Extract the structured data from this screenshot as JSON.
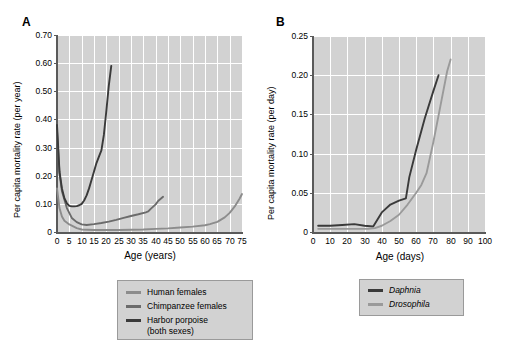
{
  "figure": {
    "panels": [
      {
        "label": "A",
        "ylabel": "Per capita mortality rate (per year)",
        "xlabel": "Age (years)"
      },
      {
        "label": "B",
        "ylabel": "Per capita mortality rate (per day)",
        "xlabel": "Age (days)"
      }
    ]
  },
  "legend_a": {
    "items": [
      {
        "label": "Human females",
        "color": "#8c8c8c"
      },
      {
        "label": "Chimpanzee females",
        "color": "#6b6b6b"
      },
      {
        "label": "Harbor porpoise\n(both sexes)",
        "color": "#3a3a3a"
      }
    ]
  },
  "legend_b": {
    "items": [
      {
        "label": "Daphnia",
        "color": "#3a3a3a"
      },
      {
        "label": "Drosophila",
        "color": "#9a9a9a"
      }
    ]
  },
  "chart_data": [
    {
      "type": "line",
      "panel": "A",
      "title": "",
      "xlabel": "Age (years)",
      "ylabel": "Per capita mortality rate (per year)",
      "xlim": [
        0,
        75
      ],
      "ylim": [
        0,
        0.7
      ],
      "xticks": [
        0,
        5,
        10,
        15,
        20,
        25,
        30,
        35,
        40,
        45,
        50,
        55,
        60,
        65,
        70,
        75
      ],
      "xticklabels": [
        "0",
        "5",
        "10",
        "15",
        "20",
        "25",
        "30",
        "35",
        "40",
        "45",
        "50",
        "55",
        "60",
        "65",
        "70",
        "75"
      ],
      "yticks": [
        0,
        0.1,
        0.2,
        0.3,
        0.4,
        0.5,
        0.6,
        0.7
      ],
      "yticklabels": [
        "0",
        "0.10",
        "0.20",
        "0.30",
        "0.40",
        "0.50",
        "0.60",
        "0.70"
      ],
      "grid": true,
      "legend_position": "below",
      "series": [
        {
          "name": "Human females",
          "color": "#8c8c8c",
          "x": [
            0,
            1,
            2,
            3,
            5,
            8,
            10,
            15,
            20,
            25,
            30,
            35,
            40,
            45,
            50,
            55,
            60,
            62,
            65,
            68,
            70,
            72,
            74,
            75
          ],
          "y": [
            0.155,
            0.085,
            0.055,
            0.04,
            0.027,
            0.014,
            0.009,
            0.007,
            0.007,
            0.007,
            0.008,
            0.009,
            0.011,
            0.013,
            0.016,
            0.019,
            0.024,
            0.028,
            0.036,
            0.052,
            0.068,
            0.09,
            0.118,
            0.135
          ]
        },
        {
          "name": "Chimpanzee females",
          "color": "#6b6b6b",
          "x": [
            0,
            1,
            2,
            4,
            6,
            8,
            10,
            12,
            15,
            18,
            21,
            24,
            27,
            30,
            33,
            36,
            37,
            38,
            40,
            41,
            43
          ],
          "y": [
            0.36,
            0.21,
            0.145,
            0.085,
            0.05,
            0.035,
            0.027,
            0.025,
            0.028,
            0.032,
            0.037,
            0.043,
            0.05,
            0.057,
            0.063,
            0.07,
            0.073,
            0.082,
            0.098,
            0.11,
            0.125
          ]
        },
        {
          "name": "Harbor porpoise (both sexes)",
          "color": "#3a3a3a",
          "x": [
            0,
            1,
            2,
            3,
            4,
            5,
            6,
            7,
            8,
            9,
            10,
            11,
            12,
            13,
            14,
            15,
            16,
            17,
            18,
            19,
            20,
            21,
            22
          ],
          "y": [
            0.38,
            0.215,
            0.155,
            0.12,
            0.102,
            0.093,
            0.091,
            0.091,
            0.092,
            0.095,
            0.1,
            0.112,
            0.13,
            0.155,
            0.185,
            0.215,
            0.245,
            0.268,
            0.29,
            0.345,
            0.43,
            0.52,
            0.59
          ]
        }
      ]
    },
    {
      "type": "line",
      "panel": "B",
      "title": "",
      "xlabel": "Age (days)",
      "ylabel": "Per capita mortality rate (per day)",
      "xlim": [
        0,
        100
      ],
      "ylim": [
        0,
        0.25
      ],
      "xticks": [
        0,
        10,
        20,
        30,
        40,
        50,
        60,
        70,
        80,
        90,
        100
      ],
      "xticklabels": [
        "0",
        "10",
        "20",
        "30",
        "40",
        "50",
        "60",
        "70",
        "80",
        "90",
        "100"
      ],
      "yticks": [
        0,
        0.05,
        0.1,
        0.15,
        0.2,
        0.25
      ],
      "yticklabels": [
        "0",
        "0.05",
        "0.10",
        "0.15",
        "0.20",
        "0.25"
      ],
      "grid": true,
      "legend_position": "below",
      "series": [
        {
          "name": "Daphnia",
          "color": "#3a3a3a",
          "x": [
            3,
            10,
            17,
            24,
            30,
            35,
            40,
            45,
            50,
            54,
            56,
            60,
            65,
            70,
            73
          ],
          "y": [
            0.008,
            0.008,
            0.009,
            0.01,
            0.008,
            0.007,
            0.025,
            0.035,
            0.04,
            0.043,
            0.07,
            0.105,
            0.145,
            0.18,
            0.2
          ]
        },
        {
          "name": "Drosophila",
          "color": "#9a9a9a",
          "x": [
            3,
            15,
            25,
            32,
            36,
            40,
            45,
            50,
            55,
            60,
            63,
            66,
            70,
            74,
            78,
            80
          ],
          "y": [
            0.004,
            0.004,
            0.004,
            0.004,
            0.005,
            0.008,
            0.014,
            0.022,
            0.035,
            0.05,
            0.06,
            0.075,
            0.115,
            0.16,
            0.205,
            0.22
          ]
        }
      ]
    }
  ]
}
